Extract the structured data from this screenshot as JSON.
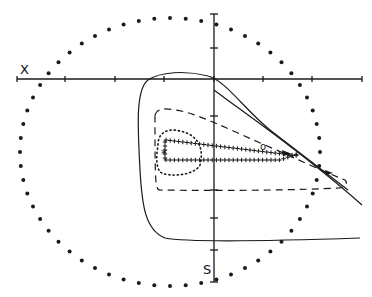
{
  "diagram": {
    "axis_labels": {
      "x": "X",
      "s": "S"
    },
    "colors": {
      "ink": "#1a1a1a",
      "background": "#ffffff"
    },
    "horizontal_axis": {
      "y": 79,
      "x_start": 17,
      "x_end": 362,
      "ticks": [
        17,
        65,
        115,
        164,
        214,
        263,
        312,
        362
      ]
    },
    "vertical_axis": {
      "x": 214,
      "y_start": 14,
      "y_end": 282,
      "ticks": [
        14,
        48,
        116,
        190,
        218,
        250,
        282
      ]
    },
    "dotted_circle": {
      "cx": 170,
      "cy": 152,
      "rx": 150,
      "ry": 134,
      "dot_count": 60
    },
    "markers": {
      "origin_marker": "o",
      "star_marker": "*"
    },
    "contours": [
      {
        "name": "outer-solid",
        "style": "solid"
      },
      {
        "name": "dashed",
        "style": "dashed"
      },
      {
        "name": "dotted",
        "style": "dotted"
      },
      {
        "name": "cross-track",
        "style": "plus-markers"
      }
    ]
  }
}
